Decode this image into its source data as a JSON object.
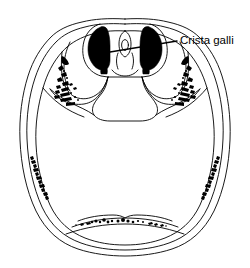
{
  "figure": {
    "kind": "anatomical-illustration",
    "background_color": "#ffffff",
    "line_color": "#000000",
    "fill_color": "#000000",
    "line_width": "0.9"
  },
  "labels": [
    {
      "id": "crista-galli",
      "text": "Crista galli",
      "text_x": 180,
      "text_y": 41,
      "leader": {
        "from_x": 110,
        "from_y": 52,
        "to_x": 177,
        "to_y": 41
      }
    }
  ],
  "structures": {
    "cranial_vault_outer": "outer table of calvaria outline",
    "cranial_vault_diploe": "diploe layer between tables",
    "cranial_vault_inner": "inner table of calvaria outline",
    "anterior_cranial_fossa": "anterior cranial fossa with orbital plates",
    "cribriform_plate_left": "left cribriform plate of ethmoid (black)",
    "cribriform_plate_right": "right cribriform plate of ethmoid (black)",
    "crista_galli_ridge": "crista galli midline ridge",
    "lesser_wing_left": "left lesser wing of sphenoid",
    "lesser_wing_right": "right lesser wing of sphenoid",
    "orbital_stipple_left": "left orbital plate cancellous stippling",
    "orbital_stipple_right": "right orbital plate cancellous stippling",
    "diploe_stipple_left": "left lateral diploe hatching",
    "diploe_stipple_right": "right lateral diploe hatching",
    "occipital_stipple": "posterior occipital stippling"
  }
}
